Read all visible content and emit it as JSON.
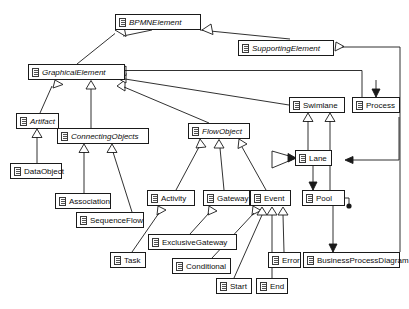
{
  "diagram": {
    "type": "uml-class-diagram",
    "canvas": {
      "width": 409,
      "height": 309
    },
    "style": {
      "line_color": "#1a1a1a",
      "box_fill": "#ffffff",
      "text_color": "#0d0d0d"
    },
    "classes": [
      {
        "id": "bpmnelement",
        "label": "BPMNElement",
        "abstract": true,
        "x": 115,
        "y": 14,
        "w": 86,
        "icon": "class-icon"
      },
      {
        "id": "supportingelement",
        "label": "SupportingElement",
        "abstract": true,
        "x": 238,
        "y": 40,
        "w": 96,
        "icon": "class-icon"
      },
      {
        "id": "graphicalelement",
        "label": "GraphicalElement",
        "abstract": true,
        "x": 28,
        "y": 64,
        "w": 97,
        "icon": "class-icon"
      },
      {
        "id": "swimlane",
        "label": "Swimlane",
        "abstract": false,
        "x": 289,
        "y": 97,
        "w": 56,
        "icon": "class-icon"
      },
      {
        "id": "process",
        "label": "Process",
        "abstract": false,
        "x": 352,
        "y": 97,
        "w": 48,
        "icon": "class-icon"
      },
      {
        "id": "artifact",
        "label": "Artifact",
        "abstract": true,
        "x": 16,
        "y": 113,
        "w": 43,
        "icon": "class-icon"
      },
      {
        "id": "flowobject",
        "label": "FlowObject",
        "abstract": true,
        "x": 188,
        "y": 123,
        "w": 62,
        "icon": "class-icon"
      },
      {
        "id": "connectingobjects",
        "label": "ConnectingObjects",
        "abstract": true,
        "x": 57,
        "y": 128,
        "w": 92,
        "icon": "class-icon"
      },
      {
        "id": "lane",
        "label": "Lane",
        "abstract": false,
        "x": 295,
        "y": 150,
        "w": 37,
        "icon": "class-icon"
      },
      {
        "id": "dataobject",
        "label": "DataObject",
        "abstract": false,
        "x": 10,
        "y": 163,
        "w": 52,
        "icon": "class-icon"
      },
      {
        "id": "activity",
        "label": "Activity",
        "abstract": false,
        "x": 147,
        "y": 190,
        "w": 48,
        "icon": "class-icon"
      },
      {
        "id": "gateway",
        "label": "Gateway",
        "abstract": false,
        "x": 203,
        "y": 190,
        "w": 47,
        "icon": "class-icon"
      },
      {
        "id": "event",
        "label": "Event",
        "abstract": false,
        "x": 250,
        "y": 190,
        "w": 41,
        "icon": "class-icon"
      },
      {
        "id": "pool",
        "label": "Pool",
        "abstract": false,
        "x": 302,
        "y": 190,
        "w": 43,
        "icon": "class-icon"
      },
      {
        "id": "association",
        "label": "Association",
        "abstract": false,
        "x": 55,
        "y": 193,
        "w": 56,
        "icon": "class-icon"
      },
      {
        "id": "sequenceflow",
        "label": "SequenceFlow",
        "abstract": false,
        "x": 76,
        "y": 212,
        "w": 68,
        "icon": "class-icon"
      },
      {
        "id": "exclusivegateway",
        "label": "ExclusiveGateway",
        "abstract": false,
        "x": 148,
        "y": 234,
        "w": 89,
        "icon": "class-icon"
      },
      {
        "id": "task",
        "label": "Task",
        "abstract": false,
        "x": 110,
        "y": 252,
        "w": 36,
        "icon": "class-icon"
      },
      {
        "id": "error",
        "label": "Error",
        "abstract": false,
        "x": 268,
        "y": 252,
        "w": 33,
        "icon": "class-icon"
      },
      {
        "id": "businessprocessdiagram",
        "label": "BusinessProcessDiagram",
        "abstract": false,
        "x": 303,
        "y": 252,
        "w": 97,
        "icon": "class-icon"
      },
      {
        "id": "conditional",
        "label": "Conditional",
        "abstract": false,
        "x": 172,
        "y": 258,
        "w": 59,
        "icon": "class-icon"
      },
      {
        "id": "start",
        "label": "Start",
        "abstract": false,
        "x": 216,
        "y": 278,
        "w": 36,
        "icon": "class-icon"
      },
      {
        "id": "end",
        "label": "End",
        "abstract": false,
        "x": 256,
        "y": 278,
        "w": 32,
        "icon": "class-icon"
      }
    ],
    "relations": [
      {
        "from": "graphicalelement",
        "to": "bpmnelement",
        "type": "generalization"
      },
      {
        "from": "supportingelement",
        "to": "bpmnelement",
        "type": "generalization"
      },
      {
        "from": "artifact",
        "to": "graphicalelement",
        "type": "generalization"
      },
      {
        "from": "connectingobjects",
        "to": "graphicalelement",
        "type": "generalization"
      },
      {
        "from": "flowobject",
        "to": "graphicalelement",
        "type": "generalization"
      },
      {
        "from": "swimlane",
        "to": "graphicalelement",
        "type": "generalization"
      },
      {
        "from": "process",
        "to": "graphicalelement",
        "type": "generalization"
      },
      {
        "from": "dataobject",
        "to": "artifact",
        "type": "generalization"
      },
      {
        "from": "association",
        "to": "connectingobjects",
        "type": "generalization"
      },
      {
        "from": "sequenceflow",
        "to": "connectingobjects",
        "type": "generalization"
      },
      {
        "from": "activity",
        "to": "flowobject",
        "type": "generalization"
      },
      {
        "from": "gateway",
        "to": "flowobject",
        "type": "generalization"
      },
      {
        "from": "event",
        "to": "flowobject",
        "type": "generalization"
      },
      {
        "from": "task",
        "to": "activity",
        "type": "generalization"
      },
      {
        "from": "exclusivegateway",
        "to": "gateway",
        "type": "generalization"
      },
      {
        "from": "conditional",
        "to": "event",
        "type": "generalization"
      },
      {
        "from": "start",
        "to": "event",
        "type": "generalization"
      },
      {
        "from": "end",
        "to": "event",
        "type": "generalization"
      },
      {
        "from": "error",
        "to": "event",
        "type": "generalization"
      },
      {
        "from": "lane",
        "to": "swimlane",
        "type": "generalization"
      },
      {
        "from": "pool",
        "to": "swimlane",
        "type": "generalization"
      },
      {
        "from": "businessprocessdiagram",
        "to": "supportingelement",
        "type": "generalization"
      },
      {
        "from": "pool",
        "to": "lane",
        "type": "composition"
      },
      {
        "from": "process",
        "to": "pool",
        "type": "composition"
      },
      {
        "from": "lane",
        "to": "process",
        "type": "composition"
      },
      {
        "from": "businessprocessdiagram",
        "to": "pool",
        "type": "composition"
      }
    ]
  }
}
